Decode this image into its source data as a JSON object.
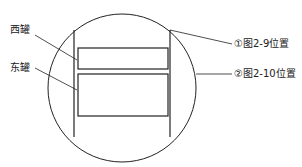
{
  "diagram": {
    "labels": {
      "west_tank": "西罐",
      "east_tank": "东罐",
      "position_1": "①图2-9位置",
      "position_2": "②图2-10位置"
    },
    "colors": {
      "stroke": "#222222",
      "background": "#ffffff"
    }
  }
}
